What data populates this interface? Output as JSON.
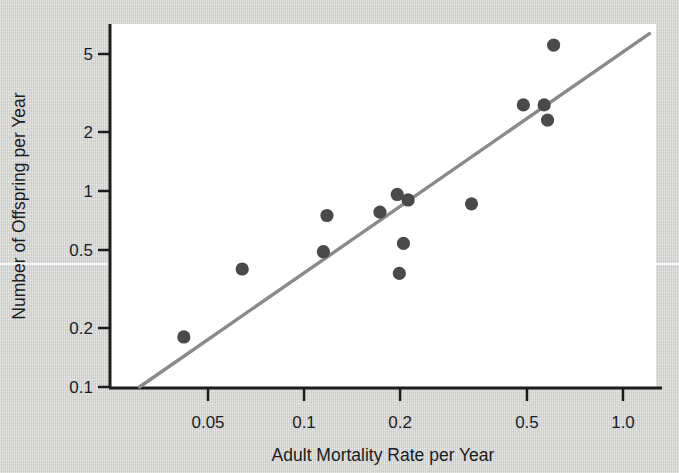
{
  "chart_data": {
    "type": "scatter",
    "title": "",
    "xlabel": "Adult Mortality Rate per Year",
    "ylabel": "Number of Offspring per Year",
    "xscale": "log",
    "yscale": "log",
    "xlim": [
      0.027,
      1.25
    ],
    "ylim": [
      0.1,
      7.2
    ],
    "grid": false,
    "legend": null,
    "xticks": [
      0.05,
      0.1,
      0.2,
      0.5,
      1.0
    ],
    "xticklabels": [
      "0.05",
      "0.1",
      "0.2",
      "0.5",
      "1.0"
    ],
    "yticks": [
      0.1,
      0.2,
      0.5,
      1,
      2,
      5
    ],
    "yticklabels": [
      "0.1",
      "0.2",
      "0.5",
      "1",
      "2",
      "5"
    ],
    "marker_color": "#4a4a4a",
    "line_color": "#8a8a8a",
    "axis_color": "#1c1c1c",
    "plot_bg": "#ffffff",
    "figure_bg": "#d6d6d4",
    "points": [
      {
        "x": 0.042,
        "y": 0.18
      },
      {
        "x": 0.064,
        "y": 0.4
      },
      {
        "x": 0.115,
        "y": 0.49
      },
      {
        "x": 0.118,
        "y": 0.75
      },
      {
        "x": 0.173,
        "y": 0.78
      },
      {
        "x": 0.196,
        "y": 0.96
      },
      {
        "x": 0.199,
        "y": 0.38
      },
      {
        "x": 0.205,
        "y": 0.54
      },
      {
        "x": 0.212,
        "y": 0.9
      },
      {
        "x": 0.335,
        "y": 0.86
      },
      {
        "x": 0.487,
        "y": 2.75
      },
      {
        "x": 0.566,
        "y": 2.75
      },
      {
        "x": 0.58,
        "y": 2.3
      },
      {
        "x": 0.606,
        "y": 5.55
      }
    ],
    "trendline": {
      "type": "fit-line",
      "x_start": 0.0305,
      "y_start": 0.1,
      "x_end": 1.21,
      "y_end": 6.35
    }
  },
  "axes": {
    "x_tick_labels": [
      "0.05",
      "0.1",
      "0.2",
      "0.5",
      "1.0"
    ],
    "y_tick_labels": [
      "5",
      "2",
      "1",
      "0.5",
      "0.2",
      "0.1"
    ],
    "x_axis_title": "Adult Mortality Rate per Year",
    "y_axis_title": "Number of Offspring per Year"
  }
}
